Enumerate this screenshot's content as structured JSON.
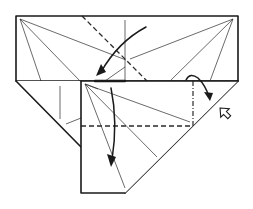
{
  "diagram": {
    "type": "origami-fold-diagram",
    "colors": {
      "background": "#ffffff",
      "line": "#1a1a1a"
    },
    "elements": {
      "top_panel": {
        "shape": "rectangle",
        "x": 16,
        "y": 16,
        "w": 222,
        "h": 65
      },
      "left_triangle": {
        "shape": "triangle",
        "points": [
          [
            16,
            81
          ],
          [
            81,
            81
          ],
          [
            81,
            147
          ]
        ]
      },
      "front_flap": {
        "shape": "pentagon",
        "points": [
          [
            81,
            81
          ],
          [
            238,
            81
          ],
          [
            125,
            193
          ],
          [
            81,
            193
          ]
        ]
      },
      "valley_fold_diagonal": {
        "line": "dashed",
        "from": [
          82,
          16
        ],
        "to": [
          147,
          81
        ]
      },
      "valley_fold_horizontal": {
        "line": "dashed",
        "from": [
          81,
          126
        ],
        "to": [
          193,
          126
        ]
      },
      "mountain_fold_vertical": {
        "line": "dash-dot",
        "from": [
          193,
          81
        ],
        "to": [
          193,
          126
        ]
      },
      "arrow_fold_down_left": {
        "type": "valley-fold-arrow",
        "direction": "down-left"
      },
      "arrow_fold_down_flap": {
        "type": "valley-fold-arrow",
        "direction": "down"
      },
      "arrow_fold_over_right": {
        "type": "curved-fold-arrow",
        "direction": "right"
      },
      "arrow_hollow_push": {
        "type": "push/turn hollow arrow",
        "direction": "up-left"
      }
    }
  }
}
